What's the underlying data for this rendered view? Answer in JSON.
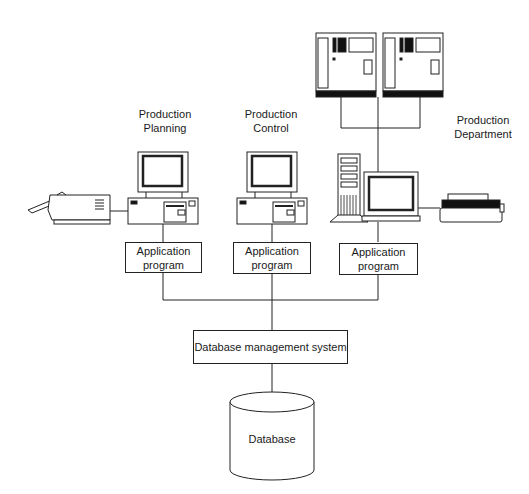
{
  "diagram": {
    "departments": [
      {
        "id": "planning",
        "label": "Production\nPlanning"
      },
      {
        "id": "control",
        "label": "Production\nControl"
      },
      {
        "id": "department",
        "label": "Production\nDepartment"
      }
    ],
    "app_boxes": [
      {
        "label": "Application\nprogram"
      },
      {
        "label": "Application\nprogram"
      },
      {
        "label": "Application\nprogram"
      }
    ],
    "dbms": {
      "label": "Database management system"
    },
    "database": {
      "label": "Database"
    },
    "devices": {
      "planning": [
        "fax-machine",
        "desktop-computer"
      ],
      "control": [
        "desktop-computer"
      ],
      "department": [
        "mainframe",
        "mainframe",
        "tower-workstation",
        "dot-matrix-printer"
      ]
    },
    "colors": {
      "line": "#222222",
      "background": "#ffffff",
      "fill_dark": "#1a1a1a"
    }
  }
}
